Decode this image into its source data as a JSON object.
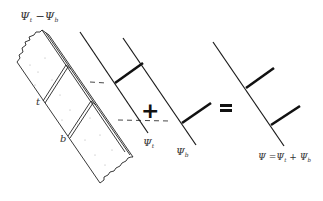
{
  "slab": {
    "label_top": "t",
    "label_bottom": "b"
  },
  "operators": {
    "plus": "+",
    "equals": "="
  },
  "labels": {
    "psi_t": "Ψt",
    "psi_b": "Ψb",
    "result": "Ψ=Ψt + Ψb"
  },
  "colors": {
    "ink": "#1a1a1a",
    "paper": "#ffffff"
  }
}
